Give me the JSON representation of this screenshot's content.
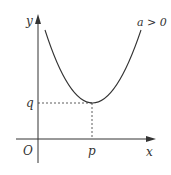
{
  "diagram": {
    "type": "parabola-graph",
    "axes": {
      "x_label": "x",
      "y_label": "y",
      "origin_label": "O"
    },
    "vertex": {
      "x_label": "p",
      "y_label": "q"
    },
    "condition_label": "a > 0",
    "colors": {
      "stroke": "#333333",
      "background": "#ffffff"
    }
  }
}
